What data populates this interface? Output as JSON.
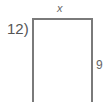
{
  "problem": {
    "number_label": "12)",
    "figure": {
      "shape": "rectangle",
      "top_side_label": "x",
      "right_side_label": "9",
      "stroke_color": "#7a7a7a"
    }
  }
}
